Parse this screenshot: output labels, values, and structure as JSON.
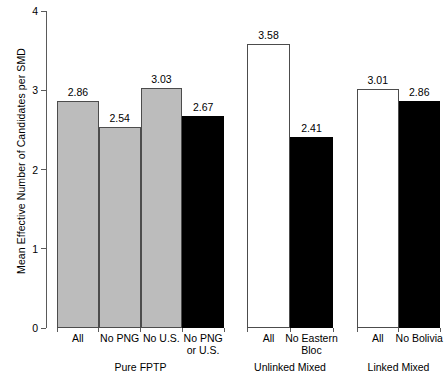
{
  "chart_data": {
    "type": "bar",
    "title": "",
    "xlabel": "",
    "ylabel": "Mean Effective Number of Candidates per SMD",
    "ylim": [
      0,
      4
    ],
    "yticks": [
      "0",
      "1",
      "2",
      "3",
      "4"
    ],
    "grid": false,
    "legend": "none",
    "groups": [
      {
        "name": "Pure FPTP",
        "categories": [
          "All",
          "No PNG",
          "No U.S.",
          "No PNG or U.S."
        ],
        "category_lines": [
          [
            "All"
          ],
          [
            "No PNG"
          ],
          [
            "No U.S."
          ],
          [
            "No PNG",
            "or U.S."
          ]
        ],
        "values": [
          2.86,
          2.54,
          3.03,
          2.67
        ],
        "value_labels": [
          "2.86",
          "2.54",
          "3.03",
          "2.67"
        ],
        "fills": [
          "gray",
          "gray",
          "gray",
          "black"
        ]
      },
      {
        "name": "Unlinked Mixed",
        "categories": [
          "All",
          "No Eastern Bloc"
        ],
        "category_lines": [
          [
            "All"
          ],
          [
            "No Eastern",
            "Bloc"
          ]
        ],
        "values": [
          3.58,
          2.41
        ],
        "value_labels": [
          "3.58",
          "2.41"
        ],
        "fills": [
          "white",
          "black"
        ]
      },
      {
        "name": "Linked Mixed",
        "categories": [
          "All",
          "No Bolivia"
        ],
        "category_lines": [
          [
            "All"
          ],
          [
            "No Bolivia"
          ]
        ],
        "values": [
          3.01,
          2.86
        ],
        "value_labels": [
          "3.01",
          "2.86"
        ],
        "fills": [
          "white",
          "black"
        ]
      }
    ],
    "colors": {
      "gray": "#bcbcbc",
      "white": "#ffffff",
      "black": "#000000",
      "axis": "#5a5a5a",
      "outline": "#4c4c4c"
    }
  }
}
